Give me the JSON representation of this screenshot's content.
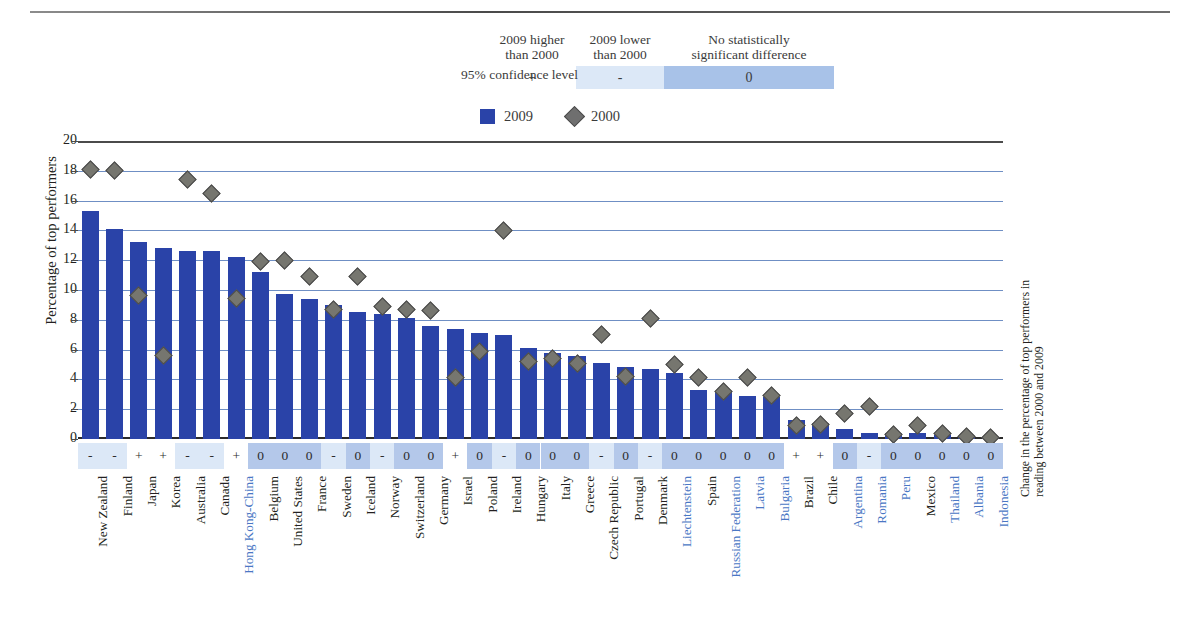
{
  "significance_key": {
    "axis_label": "95% confidence level",
    "columns": [
      {
        "heading": "2009 higher\nthan 2000",
        "symbol": "+",
        "state": "higher"
      },
      {
        "heading": "2009 lower\nthan 2000",
        "symbol": "-",
        "state": "lower"
      },
      {
        "heading": "No statistically\nsignificant difference",
        "symbol": "0",
        "state": "none"
      }
    ],
    "colors": {
      "higher": "#ffffff",
      "lower": "#dce8f7",
      "none": "#a8c2e8"
    }
  },
  "legend": {
    "items": [
      {
        "label": "2009",
        "marker": "square",
        "color": "#2a43a8"
      },
      {
        "label": "2000",
        "marker": "diamond",
        "color": "#6f6f6f"
      }
    ]
  },
  "axes": {
    "y_title": "Percentage of top performers",
    "right_title": "Change in the percentage of top performers in reading between 2000 and 2009",
    "y_ticks": [
      20,
      18,
      16,
      14,
      12,
      10,
      8,
      6,
      4,
      2,
      0
    ]
  },
  "chart_data": {
    "type": "bar",
    "title": "Percentage of top performers in reading",
    "xlabel": "",
    "ylabel": "Percentage of top performers",
    "ylim": [
      0,
      20
    ],
    "grid": true,
    "legend_position": "top",
    "categories": [
      "New Zealand",
      "Finland",
      "Japan",
      "Korea",
      "Australia",
      "Canada",
      "Hong Kong-China",
      "Belgium",
      "United States",
      "France",
      "Sweden",
      "Iceland",
      "Norway",
      "Switzerland",
      "Germany",
      "Israel",
      "Poland",
      "Ireland",
      "Hungary",
      "Italy",
      "Greece",
      "Czech Republic",
      "Portugal",
      "Denmark",
      "Liechtenstein",
      "Spain",
      "Russian Federation",
      "Latvia",
      "Bulgaria",
      "Brazil",
      "Chile",
      "Argentina",
      "Romania",
      "Peru",
      "Mexico",
      "Thailand",
      "Albania",
      "Indonesia"
    ],
    "partner_flags": [
      false,
      false,
      false,
      false,
      false,
      false,
      true,
      false,
      false,
      false,
      false,
      false,
      false,
      false,
      false,
      false,
      false,
      false,
      false,
      false,
      false,
      false,
      false,
      false,
      true,
      false,
      true,
      true,
      true,
      false,
      false,
      true,
      true,
      true,
      false,
      true,
      true,
      true
    ],
    "series": [
      {
        "name": "2009",
        "values": [
          15.3,
          14.1,
          13.2,
          12.8,
          12.6,
          12.6,
          12.2,
          11.2,
          9.7,
          9.4,
          9.0,
          8.5,
          8.4,
          8.1,
          7.6,
          7.4,
          7.1,
          7.0,
          6.1,
          5.8,
          5.6,
          5.1,
          4.8,
          4.7,
          4.4,
          3.3,
          3.2,
          2.9,
          2.8,
          1.3,
          1.1,
          0.7,
          0.4,
          0.4,
          0.4,
          0.3,
          0.2,
          0.1
        ]
      },
      {
        "name": "2000",
        "values": [
          18.1,
          18.0,
          9.6,
          5.6,
          17.4,
          16.5,
          9.4,
          11.9,
          12.0,
          10.9,
          8.7,
          10.9,
          8.9,
          8.7,
          8.6,
          4.1,
          5.9,
          14.0,
          5.2,
          5.4,
          5.1,
          7.0,
          4.2,
          8.1,
          5.0,
          4.1,
          3.2,
          4.1,
          2.9,
          0.9,
          1.0,
          1.7,
          2.2,
          0.3,
          0.9,
          0.4,
          0.2,
          0.1
        ]
      }
    ],
    "significance": [
      "-",
      "-",
      "+",
      "+",
      "-",
      "-",
      "+",
      "0",
      "0",
      "0",
      "-",
      "0",
      "-",
      "0",
      "0",
      "+",
      "0",
      "-",
      "0",
      "0",
      "0",
      "-",
      "0",
      "-",
      "0",
      "0",
      "0",
      "0",
      "0",
      "+",
      "+",
      "0",
      "-",
      "0",
      "0",
      "0",
      "0",
      "0"
    ]
  }
}
